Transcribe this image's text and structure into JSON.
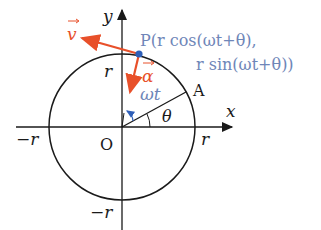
{
  "colors": {
    "axis": "#1a1a1a",
    "circle": "#1a1a1a",
    "vector_red": "#e8502a",
    "point_blue": "#2f5fb8",
    "label_blue": "#6f86b8"
  },
  "labels": {
    "y_axis": "y",
    "x_axis": "x",
    "origin": "O",
    "r_top": "r",
    "r_right": "r",
    "neg_r_left": "−r",
    "neg_r_bottom": "−r",
    "point_a": "A",
    "theta": "θ",
    "omega_t": "ωt",
    "velocity": "v",
    "acceleration": "α",
    "point_p_line1": "P(r cos(ωt+θ),",
    "point_p_line2": "r sin(ωt+θ))"
  },
  "geometry": {
    "origin": [
      122,
      127
    ],
    "radius": 73,
    "theta_deg": 28,
    "point_p": [
      139,
      54
    ]
  }
}
